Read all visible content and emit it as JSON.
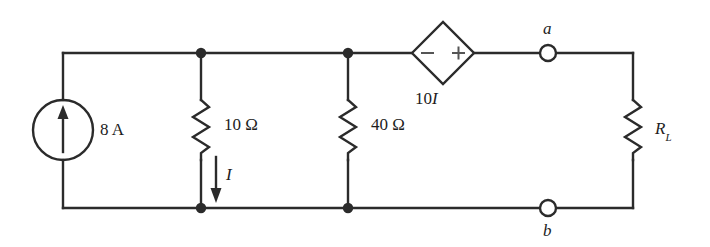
{
  "figure": {
    "type": "electrical-circuit-schematic",
    "line_color": "#2b2b2b",
    "background_color": "#ffffff",
    "width": 710,
    "height": 247
  },
  "components": {
    "current_source": {
      "name": "current-source",
      "label": "8 A",
      "value": "8",
      "unit": "A",
      "direction": "up"
    },
    "resistor_r1": {
      "name": "resistor-10-ohm",
      "label": "10 Ω",
      "value": "10",
      "unit": "Ω"
    },
    "resistor_r2": {
      "name": "resistor-40-ohm",
      "label": "40 Ω",
      "value": "40",
      "unit": "Ω"
    },
    "dependent_source": {
      "name": "dependent-voltage-source",
      "label": "10I",
      "label_prefix": "10",
      "label_variable": "I",
      "minus_sign": "−",
      "plus_sign": "+",
      "shape": "diamond"
    },
    "load_resistor": {
      "name": "load-resistor",
      "label_main": "R",
      "label_sub": "L"
    }
  },
  "annotations": {
    "current_label": "I",
    "terminal_a": "a",
    "terminal_b": "b"
  }
}
